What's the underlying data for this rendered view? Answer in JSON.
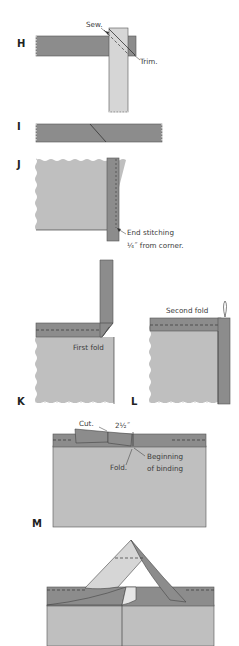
{
  "colors": {
    "binding_dark": "#8c8c8c",
    "binding_light": "#d6d6d6",
    "fabric": "#bfbfbf",
    "outline": "#555555",
    "text": "#333333",
    "background": "#ffffff"
  },
  "steps": {
    "H": {
      "label": "H",
      "notes": {
        "sew": "Sew.",
        "trim": "Trim."
      }
    },
    "I": {
      "label": "I"
    },
    "J": {
      "label": "J",
      "notes": {
        "end_line1": "End stitching",
        "end_line2": "¼˝ from corner."
      }
    },
    "K": {
      "label": "K",
      "notes": {
        "first_fold": "First fold"
      }
    },
    "L": {
      "label": "L",
      "notes": {
        "second_fold": "Second fold"
      }
    },
    "M": {
      "label": "M",
      "notes": {
        "cut": "Cut.",
        "measure": "2½˝",
        "fold": "Fold.",
        "begin_line1": "Beginning",
        "begin_line2": "of binding"
      }
    },
    "N": {
      "label": ""
    }
  }
}
